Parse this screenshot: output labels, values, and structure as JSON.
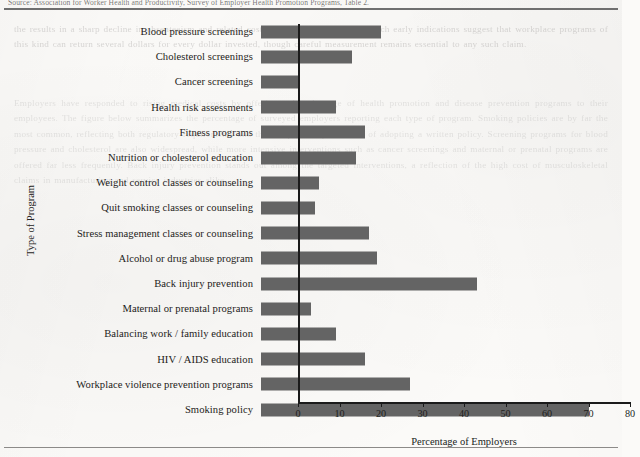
{
  "page": {
    "clipped_caption": "Source: Association for Worker Health and Productivity, Survey of Employer Health Promotion Programs, Table 2.",
    "ghost_text_top": "the results in a sharp decline in absenteeism and related costs over the period studied. Such early indications suggest that workplace programs of this kind can return several dollars for every dollar invested, though careful measurement remains essential to any such claim.",
    "ghost_text_body": "Employers have responded to rising medical costs by offering a broad range of health promotion and disease prevention programs to their employees. The figure below summarizes the percentage of surveyed employers reporting each type of program. Smoking policies are by far the most common, reflecting both regulatory requirements and the comparatively low cost of adopting a written policy. Screening programs for blood pressure and cholesterol are also widespread, while more intensive interventions such as cancer screenings and maternal or prenatal programs are offered far less frequently. Back injury prevention stands out among the targeted interventions, a reflection of the high cost of musculoskeletal claims in manufacturing and service industries alike."
  },
  "chart_data": {
    "type": "bar",
    "orientation": "horizontal",
    "title": "",
    "xlabel": "Percentage of Employers",
    "ylabel": "Type of Program",
    "xlim": [
      0,
      80
    ],
    "xticks": [
      0,
      10,
      20,
      30,
      40,
      50,
      60,
      70,
      80
    ],
    "grid": false,
    "legend": null,
    "bar_color": "#646464",
    "axis_color": "#1b1b1b",
    "categories": [
      "Blood pressure screenings",
      "Cholesterol screenings",
      "Cancer screenings",
      "Health risk assessments",
      "Fitness programs",
      "Nutrition or cholesterol education",
      "Weight control classes or counseling",
      "Quit smoking classes or counseling",
      "Stress management classes or counseling",
      "Alcohol or drug abuse program",
      "Back injury prevention",
      "Maternal or prenatal programs",
      "Balancing work / family education",
      "HIV / AIDS education",
      "Workplace violence prevention programs",
      "Smoking policy"
    ],
    "values": [
      29,
      22,
      9,
      18,
      25,
      23,
      14,
      13,
      26,
      28,
      52,
      12,
      18,
      25,
      36,
      79
    ]
  }
}
